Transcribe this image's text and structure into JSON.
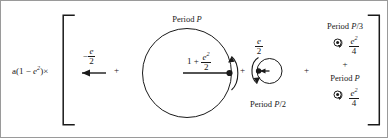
{
  "figure": {
    "kind": "fourier-epicycle-decomposition-diagram",
    "colors": {
      "ink": "#1a1a1a",
      "border": "#9a9a9a",
      "background": "#ffffff"
    }
  },
  "prefactor": {
    "name": "a(1 - e^2) times",
    "parts": {
      "lead": "a(1 − ",
      "var": "e",
      "sup": "2",
      "tail": ")×"
    },
    "plain": "a(1 − e²)×"
  },
  "brackets": {
    "left": "[",
    "right": "]"
  },
  "operators": {
    "plus1": "+",
    "plus2": "+",
    "plus3": "+",
    "plus4": "+",
    "plus5": "+"
  },
  "term1": {
    "name": "constant-offset-arrow-term",
    "coefficient": {
      "sign": "−",
      "numerator": "e",
      "denominator": "2",
      "plain": "− e/2"
    },
    "arrow_direction": "left"
  },
  "term2": {
    "name": "main-circle-period-P",
    "period_label": {
      "lead": "Period ",
      "symbol": "P",
      "plain": "Period P"
    },
    "radius_label": {
      "lead": "1 + ",
      "numerator_var": "e",
      "numerator_sup": "2",
      "denominator": "2",
      "plain": "1 + e²/2"
    }
  },
  "term3": {
    "name": "epicycle-period-P-over-2",
    "coefficient": {
      "numerator": "e",
      "denominator": "2",
      "plain": "e/2"
    },
    "period_label": {
      "lead": "Period ",
      "symbol": "P",
      "suffix": "/2",
      "plain": "Period P/2"
    }
  },
  "term4": {
    "name": "harmonic-period-P-over-3",
    "period_label": {
      "lead": "Period ",
      "symbol": "P",
      "suffix": "/3",
      "plain": "Period P/3"
    },
    "icon": "circular-arrow-icon",
    "coefficient": {
      "numerator_var": "e",
      "numerator_sup": "2",
      "denominator": "4",
      "plain": "e²/4"
    }
  },
  "term5": {
    "name": "harmonic-period-P",
    "period_label": {
      "lead": "Period ",
      "symbol": "P",
      "plain": "Period P"
    },
    "icon": "circular-arrow-icon",
    "coefficient": {
      "numerator_var": "e",
      "numerator_sup": "2",
      "denominator": "4",
      "plain": "e²/4"
    }
  }
}
